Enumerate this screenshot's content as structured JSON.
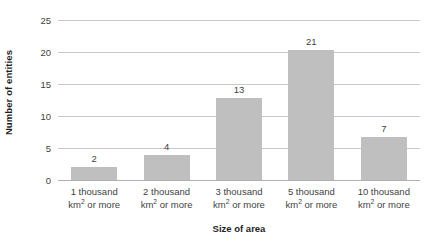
{
  "chart_data": {
    "type": "bar",
    "title": "",
    "xlabel": "Size of area",
    "ylabel": "Number of entities",
    "categories": [
      "1 thousand km2 or more",
      "2 thousand km2 or more",
      "3 thousand km2 or more",
      "5 thousand km2 or more",
      "10 thousand km2 or more"
    ],
    "category_lines": [
      {
        "line1": "1 thousand",
        "prefix": "km",
        "sup": "2",
        "suffix": " or more"
      },
      {
        "line1": "2 thousand",
        "prefix": "km",
        "sup": "2",
        "suffix": " or more"
      },
      {
        "line1": "3 thousand",
        "prefix": "km",
        "sup": "2",
        "suffix": " or more"
      },
      {
        "line1": "5 thousand",
        "prefix": "km",
        "sup": "2",
        "suffix": " or more"
      },
      {
        "line1": "10 thousand",
        "prefix": "km",
        "sup": "2",
        "suffix": " or more"
      }
    ],
    "values": [
      2,
      4,
      13,
      21,
      7
    ],
    "bar_heights": [
      2.0,
      3.9,
      12.8,
      20.3,
      6.7
    ],
    "data_labels": [
      "2",
      "4",
      "13",
      "21",
      "7"
    ],
    "ylim": [
      0,
      25
    ],
    "yticks": [
      0,
      5,
      10,
      15,
      20,
      25
    ],
    "ytick_labels": [
      "0",
      "5",
      "10",
      "15",
      "20",
      "25"
    ],
    "grid": true,
    "legend": false,
    "bar_color": "#bfbfbf",
    "gridline_color": "#c9c9c9",
    "axis_color": "#b0b0b0",
    "text_color": "#3f3f3f"
  }
}
